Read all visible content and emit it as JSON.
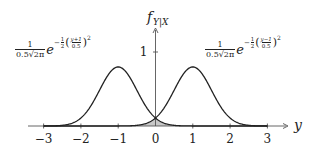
{
  "chart_data": {
    "type": "line",
    "title": "",
    "xlabel": "y",
    "ylabel": "f_{Y|X}",
    "ylabel_main": "f",
    "ylabel_sub": "Y|X",
    "xlim": [
      -3.5,
      3.5
    ],
    "ylim": [
      0,
      1.25
    ],
    "grid": false,
    "x_ticks": [
      -3,
      -2,
      -1,
      0,
      1,
      2,
      3
    ],
    "x_tick_labels": [
      "−3",
      "−2",
      "−1",
      "0",
      "1",
      "2",
      "3"
    ],
    "y_ticks": [
      1
    ],
    "y_tick_labels": [
      "1"
    ],
    "series": [
      {
        "name": "left-gaussian",
        "mean": -1,
        "sigma": 0.5,
        "peak": 0.798,
        "label": "1/(0.5√(2π)) e^{-1/2((y+1)/0.5)^2}",
        "x": [
          -3,
          -2.5,
          -2,
          -1.5,
          -1.25,
          -1,
          -0.75,
          -0.5,
          0,
          0.5,
          1,
          2,
          3
        ],
        "values": [
          0.0003,
          0.009,
          0.108,
          0.484,
          0.704,
          0.798,
          0.704,
          0.484,
          0.108,
          0.009,
          0.0003,
          0.0,
          0.0
        ]
      },
      {
        "name": "right-gaussian",
        "mean": 1,
        "sigma": 0.5,
        "peak": 0.798,
        "label": "1/(0.5√(2π)) e^{-1/2((y-1)/0.5)^2}",
        "x": [
          -3,
          -2,
          -1,
          -0.5,
          0,
          0.5,
          0.75,
          1,
          1.25,
          1.5,
          2,
          2.5,
          3
        ],
        "values": [
          0.0,
          0.0,
          0.0003,
          0.009,
          0.108,
          0.484,
          0.704,
          0.798,
          0.704,
          0.484,
          0.108,
          0.009,
          0.0003
        ]
      }
    ],
    "shaded_overlap": {
      "description": "region under min of both curves around y=0",
      "color": "#c8c8c8"
    },
    "annotations": [
      {
        "id": "left-formula",
        "num": "1",
        "den_prefix": "0.5",
        "den_sqrt": "2π",
        "base": "e",
        "exp_sign": "−",
        "exp_frac_num": "1",
        "exp_frac_den": "2",
        "inner_num": "y+1",
        "inner_den": "0.5",
        "power": "2"
      },
      {
        "id": "right-formula",
        "num": "1",
        "den_prefix": "0.5",
        "den_sqrt": "2π",
        "base": "e",
        "exp_sign": "−",
        "exp_frac_num": "1",
        "exp_frac_den": "2",
        "inner_num": "y−1",
        "inner_den": "0.5",
        "power": "2"
      }
    ],
    "colors": {
      "curve": "#222222",
      "axis": "#555555",
      "shade": "#c8c8c8"
    }
  }
}
